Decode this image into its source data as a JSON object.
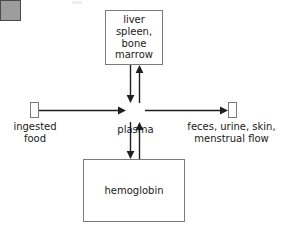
{
  "diagram": {
    "nodes": {
      "organ": {
        "label": "liver\nspleen,\nbone\nmarrow",
        "shape": "rectangle",
        "fill": "#ffffff",
        "stroke": "#7a7a7a"
      },
      "plasma": {
        "label": "plasma",
        "shape": "square",
        "fill": "#9d9d9d",
        "stroke": "#4a4a4a"
      },
      "ingested": {
        "label": "ingested\nfood",
        "shape": "small-rectangle",
        "fill": "#ffffff",
        "stroke": "#7a7a7a"
      },
      "excretion": {
        "label": "feces, urine, skin,\nmenstrual flow",
        "shape": "small-rectangle",
        "fill": "#ffffff",
        "stroke": "#7a7a7a"
      },
      "hemoglobin": {
        "label": "hemoglobin",
        "shape": "rectangle",
        "fill": "#ffffff",
        "stroke": "#7a7a7a"
      }
    },
    "edges": [
      {
        "name": "ingested-to-plasma",
        "from": "ingested",
        "to": "plasma",
        "direction": "right"
      },
      {
        "name": "plasma-to-excretion",
        "from": "plasma",
        "to": "excretion",
        "direction": "right"
      },
      {
        "name": "organ-to-plasma",
        "from": "organ",
        "to": "plasma",
        "direction": "down"
      },
      {
        "name": "plasma-to-organ",
        "from": "plasma",
        "to": "organ",
        "direction": "up"
      },
      {
        "name": "plasma-to-hemoglobin",
        "from": "plasma",
        "to": "hemoglobin",
        "direction": "down"
      },
      {
        "name": "hemoglobin-to-plasma",
        "from": "hemoglobin",
        "to": "plasma",
        "direction": "up"
      }
    ]
  }
}
